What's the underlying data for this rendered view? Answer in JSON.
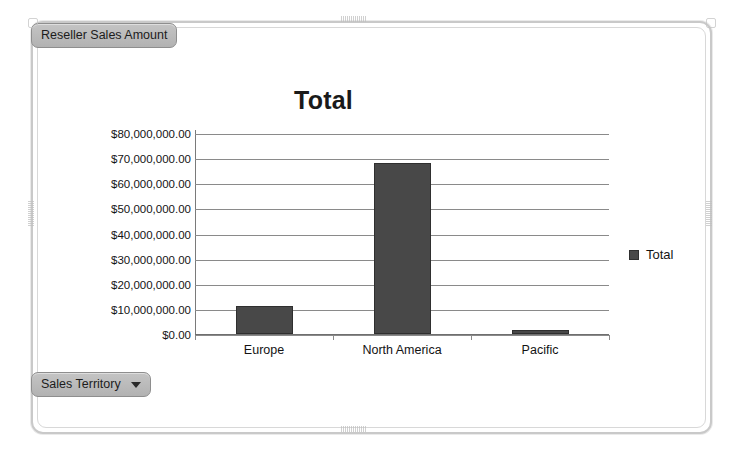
{
  "field_button": {
    "label": "Reseller Sales Amount",
    "name": "reseller-sales-amount"
  },
  "filter_button": {
    "label": "Sales Territory",
    "icon": "chevron-down-icon"
  },
  "legend": {
    "position": "right",
    "entries": [
      {
        "label": "Total",
        "color": "#484848",
        "marker": "square"
      }
    ]
  },
  "colors": {
    "bar": "#484848",
    "bar_border": "#2f2f2f",
    "gridline": "#8a8a8a",
    "axis": "#6f6f6f",
    "frame": "#c9c9c9",
    "pill_background": "#b8b8b8",
    "pill_border": "#8e8e8e",
    "text": "#141414"
  },
  "chart_data": {
    "type": "bar",
    "title": "Total",
    "xlabel": "",
    "ylabel": "",
    "categories": [
      "Europe",
      "North America",
      "Pacific"
    ],
    "series": [
      {
        "name": "Total",
        "values": [
          11200000,
          68100000,
          1500000
        ]
      }
    ],
    "ylim": [
      0,
      80000000
    ],
    "ytick_values": [
      0,
      10000000,
      20000000,
      30000000,
      40000000,
      50000000,
      60000000,
      70000000,
      80000000
    ],
    "ytick_labels": [
      "$0.00",
      "$10,000,000.00",
      "$20,000,000.00",
      "$30,000,000.00",
      "$40,000,000.00",
      "$50,000,000.00",
      "$60,000,000.00",
      "$70,000,000.00",
      "$80,000,000.00"
    ],
    "grid": true,
    "legend_position": "right"
  }
}
